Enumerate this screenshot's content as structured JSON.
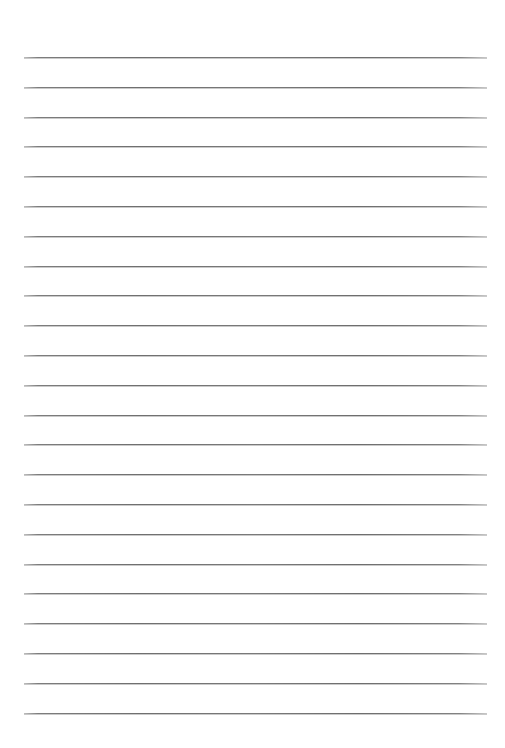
{
  "document": {
    "type": "lined-paper-template",
    "title": "Lined Paper Template",
    "page_width_px": 505,
    "page_height_px": 748,
    "background_color": "#ffffff",
    "orientation": "portrait"
  },
  "ruling": {
    "line_color": "#7a7a7a",
    "line_thickness_px": 1,
    "line_count": 23,
    "first_line_y_px": 57,
    "line_spacing_px": 29.8,
    "line_start_x_px": 24,
    "line_end_x_px": 487,
    "line_length_px": 463
  },
  "margins": {
    "top_px": 57,
    "bottom_px": 35,
    "left_px": 24,
    "right_px": 18
  },
  "lines": [
    {
      "index": 1,
      "y": 57,
      "x1": 24,
      "x2": 487
    },
    {
      "index": 2,
      "y": 87,
      "x1": 24,
      "x2": 487
    },
    {
      "index": 3,
      "y": 117,
      "x1": 24,
      "x2": 487
    },
    {
      "index": 4,
      "y": 146,
      "x1": 24,
      "x2": 487
    },
    {
      "index": 5,
      "y": 176,
      "x1": 24,
      "x2": 487
    },
    {
      "index": 6,
      "y": 206,
      "x1": 24,
      "x2": 487
    },
    {
      "index": 7,
      "y": 236,
      "x1": 24,
      "x2": 487
    },
    {
      "index": 8,
      "y": 266,
      "x1": 24,
      "x2": 487
    },
    {
      "index": 9,
      "y": 295,
      "x1": 24,
      "x2": 487
    },
    {
      "index": 10,
      "y": 325,
      "x1": 24,
      "x2": 487
    },
    {
      "index": 11,
      "y": 355,
      "x1": 24,
      "x2": 487
    },
    {
      "index": 12,
      "y": 385,
      "x1": 24,
      "x2": 487
    },
    {
      "index": 13,
      "y": 415,
      "x1": 24,
      "x2": 487
    },
    {
      "index": 14,
      "y": 444,
      "x1": 24,
      "x2": 487
    },
    {
      "index": 15,
      "y": 474,
      "x1": 24,
      "x2": 487
    },
    {
      "index": 16,
      "y": 504,
      "x1": 24,
      "x2": 487
    },
    {
      "index": 17,
      "y": 534,
      "x1": 24,
      "x2": 487
    },
    {
      "index": 18,
      "y": 564,
      "x1": 24,
      "x2": 487
    },
    {
      "index": 19,
      "y": 593,
      "x1": 24,
      "x2": 487
    },
    {
      "index": 20,
      "y": 623,
      "x1": 24,
      "x2": 487
    },
    {
      "index": 21,
      "y": 653,
      "x1": 24,
      "x2": 487
    },
    {
      "index": 22,
      "y": 683,
      "x1": 24,
      "x2": 487
    },
    {
      "index": 23,
      "y": 713,
      "x1": 24,
      "x2": 487
    }
  ]
}
